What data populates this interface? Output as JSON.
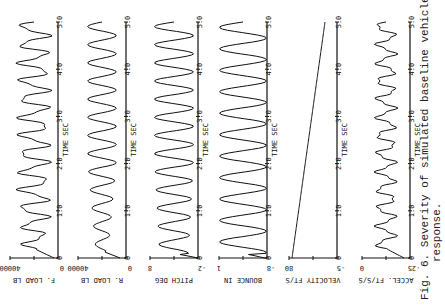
{
  "caption": {
    "line1": "Fig. 6. Severity of simulated baseline vehicle",
    "line2": "response."
  },
  "time_axis": {
    "label": "TIME SEC",
    "ticks": [
      "0",
      "1.0",
      "2.0",
      "3.0",
      "4.0",
      "5.0"
    ]
  },
  "panels": [
    {
      "id": "f-load",
      "ylabel": "F. LOAD LB",
      "ymin": "0",
      "ymax": "40000"
    },
    {
      "id": "r-load",
      "ylabel": "R. LOAD LB",
      "ymin": "0",
      "ymax": "40000"
    },
    {
      "id": "pitch",
      "ylabel": "PITCH DEG",
      "ymin": "-2",
      "ymax": "8"
    },
    {
      "id": "bounce",
      "ylabel": "BOUNCE IN",
      "ymin": "-8",
      "ymax": "1"
    },
    {
      "id": "velocity",
      "ylabel": "VELOCITY FT/S",
      "ymin": "-5",
      "ymax": "80"
    },
    {
      "id": "accel",
      "ylabel": "ACCEL. FT/S/S",
      "ymin": "-25",
      "ymax": "0"
    }
  ]
}
